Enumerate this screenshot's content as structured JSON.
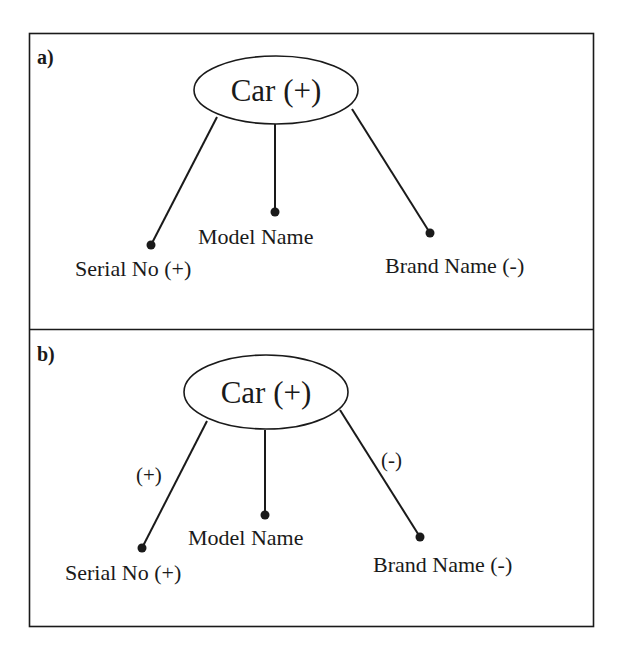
{
  "figure": {
    "panels": [
      {
        "id": "a",
        "label": "a)",
        "root": {
          "text": "Car (+)"
        },
        "children": [
          {
            "text": "Serial No (+)",
            "edge_label": ""
          },
          {
            "text": "Model Name",
            "edge_label": ""
          },
          {
            "text": "Brand Name (-)",
            "edge_label": ""
          }
        ]
      },
      {
        "id": "b",
        "label": "b)",
        "root": {
          "text": "Car (+)"
        },
        "children": [
          {
            "text": "Serial No (+)",
            "edge_label": "(+)"
          },
          {
            "text": "Model Name",
            "edge_label": ""
          },
          {
            "text": "Brand Name (-)",
            "edge_label": "(-)"
          }
        ]
      }
    ],
    "colors": {
      "stroke": "#1a1a1a",
      "background": "#ffffff"
    }
  }
}
